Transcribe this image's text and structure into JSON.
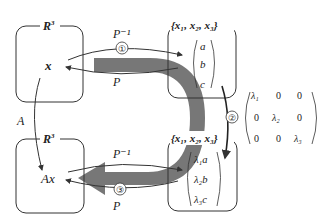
{
  "diagram": {
    "spaces": {
      "top_left": {
        "label": "R",
        "superscript": "3",
        "content": "x"
      },
      "bottom_left": {
        "label": "R",
        "superscript": "3",
        "content": "Ax"
      },
      "top_right": {
        "basis": "{x₁, x₂, x₃}",
        "vector": [
          "a",
          "b",
          "c"
        ]
      },
      "bottom_right": {
        "basis": "{x₁, x₂, x₃}",
        "vector": [
          "λ₁a",
          "λ₂b",
          "λ₃c"
        ]
      }
    },
    "arrows": {
      "top_forward": {
        "label": "P⁻¹",
        "step": "①"
      },
      "top_back": {
        "label": "P"
      },
      "left_down": {
        "label": "A"
      },
      "right_down": {
        "step": "②"
      },
      "bottom_forward": {
        "label": "P⁻¹"
      },
      "bottom_back": {
        "label": "P",
        "step": "③"
      }
    },
    "matrix": {
      "rows": [
        [
          "λ₁",
          "0",
          "0"
        ],
        [
          "0",
          "λ₂",
          "0"
        ],
        [
          "0",
          "0",
          "λ₃"
        ]
      ]
    },
    "colors": {
      "big_arrow": "#777777",
      "lines": "#333333"
    }
  }
}
